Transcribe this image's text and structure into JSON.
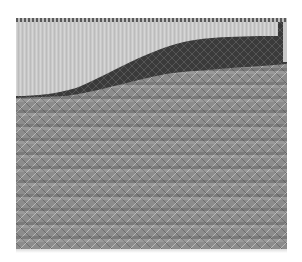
{
  "image": {
    "description": "Grayscale flame-stitch textile pattern: light upper field, dark curved band rising left to right, zigzag chevron field below",
    "colors": {
      "light_field": "#c8c8c8",
      "dark_band": "#3c3c3c",
      "chevron_base": "#8c8c8c",
      "background": "#ffffff"
    }
  }
}
